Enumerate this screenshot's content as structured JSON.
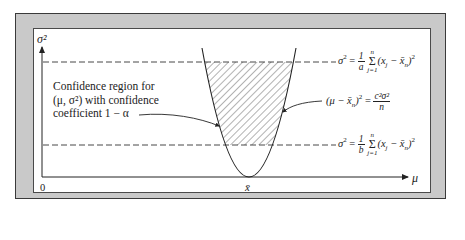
{
  "figure": {
    "axes": {
      "y_label": "σ²",
      "x_label": "μ",
      "origin_label": "0",
      "x_tick_label": "x̄"
    },
    "region_label": {
      "line1": "Confidence region for",
      "line2": "(μ, σ²) with confidence",
      "line3": "coefficient 1 − α"
    },
    "upper_bound_equation": {
      "lhs": "σ",
      "lhs_exp": "2",
      "equals": "=",
      "frac_num": "1",
      "frac_den": "a",
      "sum_upper": "n",
      "sum_lower": "j=1",
      "sum_symbol": "Σ",
      "term": "(x",
      "term_sub": "j",
      "term_mid": " − x̄",
      "term_sub2": "n",
      "term_close": ")",
      "term_exp": "2"
    },
    "lower_bound_equation": {
      "lhs": "σ",
      "lhs_exp": "2",
      "equals": "=",
      "frac_num": "1",
      "frac_den": "b",
      "sum_upper": "n",
      "sum_lower": "j=1",
      "sum_symbol": "Σ",
      "term": "(x",
      "term_sub": "j",
      "term_mid": " − x̄",
      "term_sub2": "n",
      "term_close": ")",
      "term_exp": "2"
    },
    "parabola_equation": {
      "lhs": "(μ − x̄",
      "lhs_sub": "n",
      "lhs_close": ")",
      "lhs_exp": "2",
      "equals": "=",
      "frac_num": "c²σ²",
      "frac_den": "n"
    },
    "colors": {
      "frame_gray": "#c9c9c9",
      "line": "#333333",
      "hatch": "#555555"
    }
  }
}
